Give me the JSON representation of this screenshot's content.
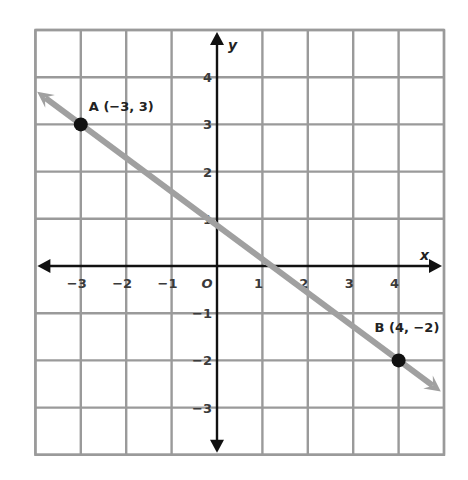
{
  "chart_data": {
    "type": "line",
    "title": "",
    "xlabel": "x",
    "ylabel": "y",
    "xlim": [
      -4,
      5
    ],
    "ylim": [
      -4,
      5
    ],
    "grid": true,
    "x_ticks": [
      -3,
      -2,
      -1,
      0,
      1,
      2,
      3,
      4
    ],
    "x_tick_labels": [
      "−3",
      "−2",
      "−1",
      "O",
      "1",
      "2",
      "3",
      "4"
    ],
    "y_ticks": [
      4,
      3,
      2,
      1,
      -1,
      -2,
      -3
    ],
    "y_tick_labels": [
      "4",
      "3",
      "2",
      "1",
      "−1",
      "−2",
      "−3"
    ],
    "series": [
      {
        "name": "line AB",
        "color": "#a0a0a0",
        "x": [
          -3.96,
          4.93
        ],
        "y": [
          3.69,
          -2.66
        ],
        "arrows": "both"
      }
    ],
    "points": [
      {
        "name": "A",
        "label": "A (−3, 3)",
        "x": -3,
        "y": 3,
        "color": "#111111"
      },
      {
        "name": "B",
        "label": "B (4, −2)",
        "x": 4,
        "y": -2,
        "color": "#111111"
      }
    ]
  }
}
